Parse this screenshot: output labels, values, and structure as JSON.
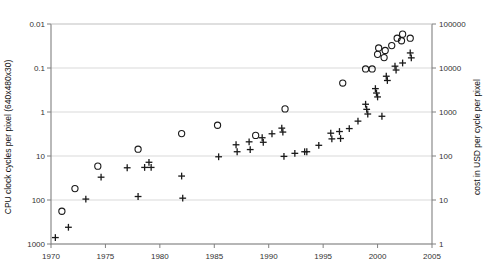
{
  "chart_data": {
    "type": "scatter",
    "title": "",
    "xlabel": "",
    "ylabel": "CPU clock cycles per pixel (640x480x30)",
    "y2label": "cost in USD per cycle per pixel",
    "xlim": [
      1970,
      2005
    ],
    "xticks": [
      "1970",
      "1975",
      "1980",
      "1985",
      "1990",
      "1995",
      "2000",
      "2005"
    ],
    "xtick_values": [
      1970,
      1975,
      1980,
      1985,
      1990,
      1995,
      2000,
      2005
    ],
    "yscale": "log",
    "ylim": [
      0.01,
      1000
    ],
    "yticks": [
      "1000",
      "100",
      "10",
      "1",
      "0.1",
      "0.01"
    ],
    "ytick_values": [
      1000,
      100,
      10,
      1,
      0.1,
      0.01
    ],
    "y2scale": "log",
    "y2lim": [
      1,
      100000
    ],
    "y2ticks": [
      "100000",
      "10000",
      "1000",
      "100",
      "10",
      "1"
    ],
    "y2tick_values": [
      100000,
      10000,
      1000,
      100,
      10,
      1
    ],
    "grid": true,
    "legend": "none",
    "marker_colors": {
      "circle": "#1a1a1a",
      "plus": "#1a1a1a"
    },
    "series": [
      {
        "name": "CPU clock cycles per pixel",
        "marker": "circle",
        "axis": "left",
        "points": [
          {
            "x": 1971.0,
            "y": 180
          },
          {
            "x": 1972.2,
            "y": 55
          },
          {
            "x": 1974.3,
            "y": 17
          },
          {
            "x": 1978.0,
            "y": 7.0
          },
          {
            "x": 1982.0,
            "y": 3.1
          },
          {
            "x": 1985.3,
            "y": 2.0
          },
          {
            "x": 1988.8,
            "y": 3.4
          },
          {
            "x": 1991.5,
            "y": 0.85
          },
          {
            "x": 1996.8,
            "y": 0.22
          },
          {
            "x": 1998.9,
            "y": 0.105
          },
          {
            "x": 1999.5,
            "y": 0.105
          },
          {
            "x": 2000.0,
            "y": 0.049
          },
          {
            "x": 2000.6,
            "y": 0.058
          },
          {
            "x": 2000.1,
            "y": 0.035
          },
          {
            "x": 2000.7,
            "y": 0.04
          },
          {
            "x": 2001.3,
            "y": 0.031
          },
          {
            "x": 2001.8,
            "y": 0.021
          },
          {
            "x": 2002.2,
            "y": 0.024
          },
          {
            "x": 2002.3,
            "y": 0.017
          },
          {
            "x": 2003.0,
            "y": 0.021
          }
        ]
      },
      {
        "name": "cost in USD per cycle per pixel",
        "marker": "plus",
        "axis": "right",
        "points": [
          {
            "x": 1970.4,
            "y": 1.4
          },
          {
            "x": 1971.6,
            "y": 2.4
          },
          {
            "x": 1973.2,
            "y": 10.5
          },
          {
            "x": 1974.6,
            "y": 33
          },
          {
            "x": 1977.0,
            "y": 54
          },
          {
            "x": 1978.0,
            "y": 12
          },
          {
            "x": 1978.6,
            "y": 55
          },
          {
            "x": 1979.0,
            "y": 72
          },
          {
            "x": 1979.2,
            "y": 55
          },
          {
            "x": 1982.0,
            "y": 35
          },
          {
            "x": 1982.1,
            "y": 11
          },
          {
            "x": 1985.4,
            "y": 96
          },
          {
            "x": 1987.0,
            "y": 180
          },
          {
            "x": 1987.1,
            "y": 125
          },
          {
            "x": 1988.2,
            "y": 210
          },
          {
            "x": 1988.3,
            "y": 140
          },
          {
            "x": 1989.4,
            "y": 260
          },
          {
            "x": 1989.5,
            "y": 205
          },
          {
            "x": 1990.3,
            "y": 320
          },
          {
            "x": 1991.2,
            "y": 430
          },
          {
            "x": 1991.3,
            "y": 350
          },
          {
            "x": 1991.4,
            "y": 98
          },
          {
            "x": 1992.4,
            "y": 115
          },
          {
            "x": 1993.3,
            "y": 125
          },
          {
            "x": 1993.5,
            "y": 125
          },
          {
            "x": 1994.6,
            "y": 175
          },
          {
            "x": 1995.7,
            "y": 330
          },
          {
            "x": 1995.8,
            "y": 245
          },
          {
            "x": 1996.5,
            "y": 360
          },
          {
            "x": 1996.6,
            "y": 250
          },
          {
            "x": 1997.4,
            "y": 420
          },
          {
            "x": 1998.2,
            "y": 620
          },
          {
            "x": 1998.9,
            "y": 1500
          },
          {
            "x": 1999.0,
            "y": 1150
          },
          {
            "x": 1999.1,
            "y": 900
          },
          {
            "x": 1999.8,
            "y": 3400
          },
          {
            "x": 1999.9,
            "y": 2700
          },
          {
            "x": 2000.0,
            "y": 2200
          },
          {
            "x": 2000.4,
            "y": 800
          },
          {
            "x": 2000.8,
            "y": 6500
          },
          {
            "x": 2000.9,
            "y": 5200
          },
          {
            "x": 2001.6,
            "y": 11000
          },
          {
            "x": 2001.7,
            "y": 9000
          },
          {
            "x": 2002.3,
            "y": 13000
          },
          {
            "x": 2003.0,
            "y": 22000
          },
          {
            "x": 2003.1,
            "y": 17000
          }
        ]
      }
    ]
  }
}
